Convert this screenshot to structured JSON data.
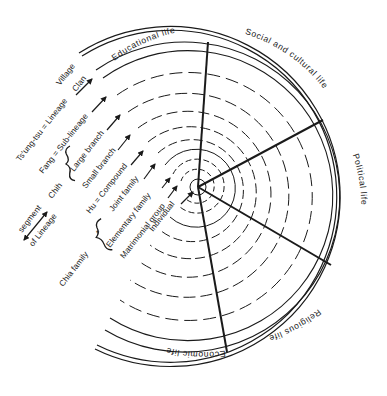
{
  "diagram": {
    "type": "concentric-social-structure",
    "ink_color": "#1a1a1a",
    "background": "#ffffff",
    "sectors": [
      {
        "label": "Educational life"
      },
      {
        "label": "Social and cultural life"
      },
      {
        "label": "Political life"
      },
      {
        "label": "Religious life"
      },
      {
        "label": "Economic life"
      }
    ],
    "levels": [
      {
        "label": "Individual",
        "style": "solid"
      },
      {
        "label": "Matrimonial group",
        "style": "dashed"
      },
      {
        "label": "Elementary family",
        "style": "dashed"
      },
      {
        "label": "Joint family",
        "style": "solid"
      },
      {
        "label": "Hu = Compound",
        "style": "dashed"
      },
      {
        "label": "Small branch",
        "style": "dashed"
      },
      {
        "label": "Large branch",
        "style": "dashed"
      },
      {
        "label": "Fang = Sub-lineage",
        "style": "dashed"
      },
      {
        "label": "Ts'ung-tsu = Lineage",
        "style": "dashed"
      },
      {
        "label": "Clan",
        "style": "solid"
      },
      {
        "label": "Village",
        "style": "double"
      }
    ],
    "groupings": [
      {
        "label": "Chia family",
        "bracket_covers": [
          "Matrimonial group",
          "Elementary family"
        ]
      },
      {
        "label": "Chih",
        "bracket_covers": [
          "Small branch",
          "Hu = Compound"
        ]
      },
      {
        "label": "segment",
        "note": "of Lineage"
      },
      {
        "label": "of Lineage"
      }
    ],
    "bracket_mark": "*"
  }
}
